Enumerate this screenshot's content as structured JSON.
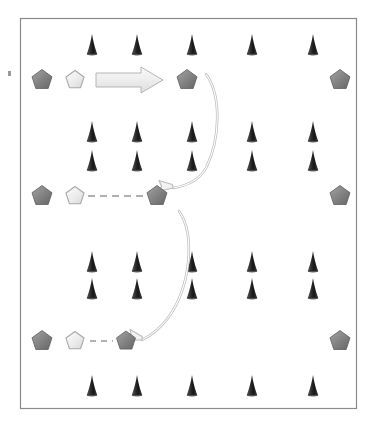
{
  "figure": {
    "title": "",
    "background_color": "#ffffff",
    "frame": {
      "name": "diagram-border",
      "x": 20,
      "y": 18,
      "width": 336,
      "height": 390,
      "stroke_color": "#8a8a8a",
      "stroke_width": 1.2,
      "fill_color": "#ffffff"
    },
    "edge_tick": {
      "name": "left-edge-tick-mark",
      "x": 8,
      "y": 71,
      "width": 3,
      "height": 5,
      "color": "#9a9a9a"
    }
  },
  "palette": {
    "dark_pentagon_fill_light": "#9a9a9a",
    "dark_pentagon_fill_dark": "#6e6e6e",
    "dark_pentagon_stroke": "#5e5e5e",
    "light_pentagon_fill_light": "#fafafa",
    "light_pentagon_fill_dark": "#dcdcdc",
    "light_pentagon_stroke": "#a8a8a8",
    "cone_fill_light": "#4a4a4a",
    "cone_fill_dark": "#1c1c1c",
    "block_arrow_fill_light": "#f4f4f4",
    "block_arrow_fill_dark": "#dedede",
    "block_arrow_stroke": "#b5b5b5",
    "curved_arrow_stroke": "#bdbdbd",
    "curved_arrow_fill": "#f2f2f2",
    "dashed_line_color": "#b0b0b0"
  },
  "cone_rows": [
    {
      "name": "cone-row-top",
      "y": 44,
      "count": 5,
      "x_positions": [
        92,
        137,
        192,
        252,
        313
      ]
    },
    {
      "name": "cone-row-upper-a",
      "y": 131,
      "count": 5,
      "x_positions": [
        92,
        137,
        192,
        252,
        313
      ]
    },
    {
      "name": "cone-row-upper-b",
      "y": 160,
      "count": 5,
      "x_positions": [
        92,
        137,
        192,
        252,
        313
      ]
    },
    {
      "name": "cone-row-lower-a",
      "y": 261,
      "count": 5,
      "x_positions": [
        92,
        137,
        192,
        252,
        313
      ]
    },
    {
      "name": "cone-row-lower-b",
      "y": 288,
      "count": 5,
      "x_positions": [
        92,
        137,
        192,
        252,
        313
      ]
    },
    {
      "name": "cone-row-bottom",
      "y": 385,
      "count": 5,
      "x_positions": [
        92,
        137,
        192,
        252,
        313
      ]
    }
  ],
  "cone": {
    "label": "cone-marker",
    "width": 11,
    "height": 20
  },
  "node_rows": [
    {
      "name": "node-row-top",
      "y": 80,
      "nodes": [
        {
          "name": "pentagon-dark-left",
          "variant": "dark",
          "x": 42,
          "size": 21
        },
        {
          "name": "pentagon-light-left",
          "variant": "light",
          "x": 75,
          "size": 19
        },
        {
          "name": "pentagon-dark-center",
          "variant": "dark",
          "x": 187,
          "size": 21
        },
        {
          "name": "pentagon-dark-right",
          "variant": "dark",
          "x": 340,
          "size": 21
        }
      ],
      "connector": {
        "name": "block-arrow-right",
        "type": "block-arrow",
        "x1": 96,
        "x2": 163,
        "thickness": 14,
        "head_length": 22,
        "head_thickness": 26
      }
    },
    {
      "name": "node-row-middle",
      "y": 196,
      "nodes": [
        {
          "name": "pentagon-dark-left",
          "variant": "dark",
          "x": 42,
          "size": 21
        },
        {
          "name": "pentagon-light-left",
          "variant": "light",
          "x": 75,
          "size": 19
        },
        {
          "name": "pentagon-dark-center",
          "variant": "dark",
          "x": 157,
          "size": 21
        },
        {
          "name": "pentagon-dark-right",
          "variant": "dark",
          "x": 340,
          "size": 21
        }
      ],
      "connector": {
        "name": "dashed-connector-middle",
        "type": "dashed-line",
        "x1": 88,
        "x2": 145,
        "dash": "7 5",
        "stroke_width": 2
      }
    },
    {
      "name": "node-row-bottom",
      "y": 341,
      "nodes": [
        {
          "name": "pentagon-dark-left",
          "variant": "dark",
          "x": 42,
          "size": 21
        },
        {
          "name": "pentagon-light-left",
          "variant": "light",
          "x": 75,
          "size": 19
        },
        {
          "name": "pentagon-dark-center",
          "variant": "dark",
          "x": 126,
          "size": 20
        },
        {
          "name": "pentagon-dark-right",
          "variant": "dark",
          "x": 340,
          "size": 21
        }
      ],
      "connector": {
        "name": "dashed-connector-bottom",
        "type": "dashed-line",
        "x1": 90,
        "x2": 113,
        "dash": "6 5",
        "stroke_width": 2
      }
    }
  ],
  "curved_arrows": [
    {
      "name": "curved-arrow-upper",
      "path": "M 206 74 C 222 96, 220 140, 206 168 C 199 181, 185 186, 173 188",
      "arrowhead_at": "end",
      "arrowhead_angle": -165,
      "arrowhead_x": 173,
      "arrowhead_y": 188
    },
    {
      "name": "curved-arrow-lower",
      "path": "M 179 211 C 196 236, 190 288, 168 318 C 159 330, 150 336, 142 340",
      "arrowhead_at": "end",
      "arrowhead_angle": -152,
      "arrowhead_x": 142,
      "arrowhead_y": 340
    }
  ]
}
